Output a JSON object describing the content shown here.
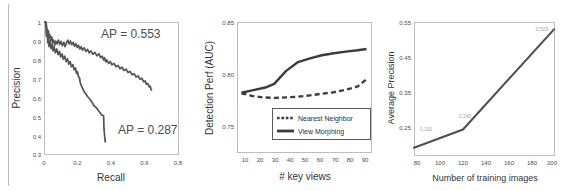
{
  "figure": {
    "panel_count": 3
  },
  "chart_data": [
    {
      "type": "line",
      "id": "precision-recall",
      "title": "",
      "xlabel": "Recall",
      "ylabel": "Precision",
      "xlim": [
        0,
        0.8
      ],
      "ylim": [
        0.3,
        1
      ],
      "xticks": [
        "0",
        "0.2",
        "0.4",
        "0.6",
        "0.8"
      ],
      "yticks": [
        "0.3",
        "0.4",
        "0.5",
        "0.6",
        "0.7",
        "0.8",
        "0.9",
        "1"
      ],
      "grid": false,
      "legend": "none",
      "annotations": [
        {
          "text": "AP = 0.553",
          "x": 0.33,
          "y": 0.905
        },
        {
          "text": "AP = 0.287",
          "x": 0.4,
          "y": 0.42
        }
      ],
      "series": [
        {
          "name": "AP = 0.553",
          "points": [
            [
              0.0,
              1.0
            ],
            [
              0.012,
              1.0
            ],
            [
              0.018,
              0.96
            ],
            [
              0.022,
              0.93
            ],
            [
              0.026,
              0.955
            ],
            [
              0.03,
              0.915
            ],
            [
              0.034,
              0.935
            ],
            [
              0.04,
              0.9
            ],
            [
              0.046,
              0.922
            ],
            [
              0.052,
              0.893
            ],
            [
              0.058,
              0.905
            ],
            [
              0.064,
              0.878
            ],
            [
              0.07,
              0.9
            ],
            [
              0.078,
              0.885
            ],
            [
              0.086,
              0.905
            ],
            [
              0.094,
              0.882
            ],
            [
              0.102,
              0.898
            ],
            [
              0.11,
              0.875
            ],
            [
              0.118,
              0.893
            ],
            [
              0.126,
              0.87
            ],
            [
              0.134,
              0.89
            ],
            [
              0.142,
              0.905
            ],
            [
              0.15,
              0.885
            ],
            [
              0.158,
              0.9
            ],
            [
              0.166,
              0.88
            ],
            [
              0.174,
              0.893
            ],
            [
              0.182,
              0.872
            ],
            [
              0.19,
              0.886
            ],
            [
              0.198,
              0.866
            ],
            [
              0.206,
              0.878
            ],
            [
              0.214,
              0.858
            ],
            [
              0.222,
              0.87
            ],
            [
              0.23,
              0.852
            ],
            [
              0.24,
              0.864
            ],
            [
              0.25,
              0.845
            ],
            [
              0.26,
              0.856
            ],
            [
              0.27,
              0.838
            ],
            [
              0.28,
              0.848
            ],
            [
              0.292,
              0.83
            ],
            [
              0.304,
              0.84
            ],
            [
              0.316,
              0.822
            ],
            [
              0.328,
              0.832
            ],
            [
              0.338,
              0.812
            ],
            [
              0.348,
              0.82
            ],
            [
              0.356,
              0.8
            ],
            [
              0.362,
              0.812
            ],
            [
              0.368,
              0.79
            ],
            [
              0.376,
              0.8
            ],
            [
              0.386,
              0.782
            ],
            [
              0.396,
              0.792
            ],
            [
              0.406,
              0.774
            ],
            [
              0.418,
              0.782
            ],
            [
              0.43,
              0.764
            ],
            [
              0.442,
              0.772
            ],
            [
              0.454,
              0.754
            ],
            [
              0.466,
              0.762
            ],
            [
              0.478,
              0.744
            ],
            [
              0.49,
              0.752
            ],
            [
              0.502,
              0.734
            ],
            [
              0.514,
              0.74
            ],
            [
              0.526,
              0.722
            ],
            [
              0.538,
              0.728
            ],
            [
              0.55,
              0.71
            ],
            [
              0.562,
              0.716
            ],
            [
              0.574,
              0.698
            ],
            [
              0.584,
              0.704
            ],
            [
              0.594,
              0.686
            ],
            [
              0.604,
              0.69
            ],
            [
              0.612,
              0.672
            ],
            [
              0.62,
              0.676
            ],
            [
              0.628,
              0.658
            ],
            [
              0.634,
              0.662
            ],
            [
              0.64,
              0.644
            ],
            [
              0.645,
              0.64
            ]
          ]
        },
        {
          "name": "AP = 0.287",
          "points": [
            [
              0.0,
              1.0
            ],
            [
              0.01,
              1.0
            ],
            [
              0.014,
              0.925
            ],
            [
              0.018,
              0.96
            ],
            [
              0.022,
              0.89
            ],
            [
              0.026,
              0.92
            ],
            [
              0.03,
              0.87
            ],
            [
              0.036,
              0.9
            ],
            [
              0.042,
              0.86
            ],
            [
              0.048,
              0.885
            ],
            [
              0.054,
              0.848
            ],
            [
              0.06,
              0.87
            ],
            [
              0.068,
              0.838
            ],
            [
              0.076,
              0.858
            ],
            [
              0.084,
              0.828
            ],
            [
              0.092,
              0.846
            ],
            [
              0.1,
              0.816
            ],
            [
              0.108,
              0.832
            ],
            [
              0.116,
              0.804
            ],
            [
              0.124,
              0.82
            ],
            [
              0.132,
              0.792
            ],
            [
              0.14,
              0.806
            ],
            [
              0.148,
              0.778
            ],
            [
              0.156,
              0.792
            ],
            [
              0.164,
              0.764
            ],
            [
              0.172,
              0.776
            ],
            [
              0.18,
              0.748
            ],
            [
              0.188,
              0.758
            ],
            [
              0.194,
              0.73
            ],
            [
              0.2,
              0.738
            ],
            [
              0.206,
              0.712
            ],
            [
              0.212,
              0.706
            ],
            [
              0.216,
              0.682
            ],
            [
              0.22,
              0.672
            ],
            [
              0.226,
              0.658
            ],
            [
              0.232,
              0.648
            ],
            [
              0.238,
              0.636
            ],
            [
              0.244,
              0.628
            ],
            [
              0.252,
              0.618
            ],
            [
              0.26,
              0.608
            ],
            [
              0.268,
              0.6
            ],
            [
              0.276,
              0.592
            ],
            [
              0.282,
              0.582
            ],
            [
              0.288,
              0.576
            ],
            [
              0.294,
              0.566
            ],
            [
              0.3,
              0.558
            ],
            [
              0.308,
              0.552
            ],
            [
              0.316,
              0.546
            ],
            [
              0.322,
              0.536
            ],
            [
              0.328,
              0.53
            ],
            [
              0.334,
              0.524
            ],
            [
              0.34,
              0.516
            ],
            [
              0.346,
              0.51
            ],
            [
              0.352,
              0.508
            ],
            [
              0.356,
              0.506
            ],
            [
              0.358,
              0.44
            ],
            [
              0.36,
              0.42
            ],
            [
              0.362,
              0.4
            ],
            [
              0.364,
              0.38
            ],
            [
              0.366,
              0.365
            ]
          ]
        }
      ]
    },
    {
      "type": "line",
      "id": "detection-perf-vs-keyviews",
      "title": "",
      "xlabel": "# key views",
      "ylabel": "Detection Perf (AUC)",
      "xlim": [
        5,
        95
      ],
      "ylim": [
        0.725,
        0.85
      ],
      "xticks": [
        "10",
        "20",
        "30",
        "40",
        "50",
        "60",
        "70",
        "80",
        "90"
      ],
      "yticks": [
        "0.75",
        "0.80",
        "0.85"
      ],
      "grid": false,
      "legend": "inside-bottom",
      "series": [
        {
          "name": "Nearest Neighbor",
          "style": "dotted",
          "x": [
            8,
            15,
            22,
            30,
            38,
            46,
            54,
            62,
            70,
            78,
            86,
            92
          ],
          "values": [
            0.7815,
            0.779,
            0.7775,
            0.777,
            0.7775,
            0.7782,
            0.7795,
            0.781,
            0.7825,
            0.7848,
            0.788,
            0.795
          ]
        },
        {
          "name": "View Morphing",
          "style": "solid",
          "x": [
            8,
            16,
            24,
            30,
            38,
            46,
            54,
            62,
            70,
            78,
            86,
            92
          ],
          "values": [
            0.782,
            0.7845,
            0.787,
            0.7905,
            0.803,
            0.8115,
            0.815,
            0.818,
            0.82,
            0.8215,
            0.8228,
            0.824
          ]
        }
      ]
    },
    {
      "type": "line",
      "id": "avg-precision-vs-training-images",
      "title": "",
      "xlabel": "Number of training images",
      "ylabel": "Average Precision",
      "xlim": [
        80,
        200
      ],
      "ylim": [
        0.17,
        0.55
      ],
      "xticks": [
        "80",
        "100",
        "120",
        "140",
        "160",
        "180",
        "200"
      ],
      "yticks": [
        "0.25",
        "0.35",
        "0.45",
        "0.55"
      ],
      "grid": false,
      "legend": "none",
      "series": [
        {
          "name": "Average Precision",
          "style": "solid",
          "x": [
            80,
            122,
            200
          ],
          "values": [
            0.191,
            0.243,
            0.529
          ],
          "point_labels": [
            "0.191",
            "0.243",
            "0.529"
          ]
        }
      ]
    }
  ]
}
